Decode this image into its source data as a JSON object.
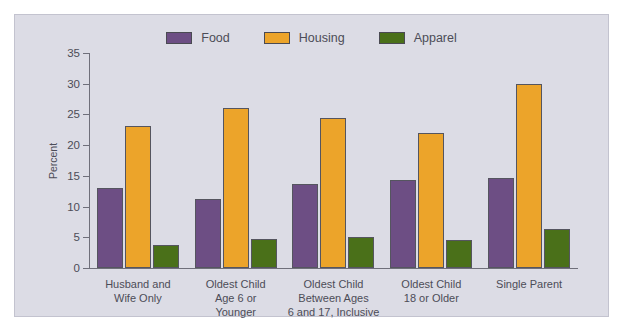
{
  "chart_data": {
    "type": "bar",
    "title": "",
    "xlabel": "",
    "ylabel": "Percent",
    "ylim": [
      0,
      35
    ],
    "yticks": [
      0,
      5,
      10,
      15,
      20,
      25,
      30,
      35
    ],
    "grid": false,
    "legend_position": "top-center",
    "categories": [
      "Husband and\nWife Only",
      "Oldest Child\nAge 6 or\nYounger",
      "Oldest Child\nBetween Ages\n6 and 17, Inclusive",
      "Oldest Child\n18 or Older",
      "Single Parent"
    ],
    "category_lines": [
      [
        "Husband and",
        "Wife Only"
      ],
      [
        "Oldest Child",
        "Age 6 or",
        "Younger"
      ],
      [
        "Oldest Child",
        "Between Ages",
        "6 and 17, Inclusive"
      ],
      [
        "Oldest Child",
        "18 or Older"
      ],
      [
        "Single Parent"
      ]
    ],
    "series": [
      {
        "name": "Food",
        "color": "#6d4e84",
        "values": [
          13.0,
          11.2,
          13.6,
          14.4,
          14.6
        ]
      },
      {
        "name": "Housing",
        "color": "#eca42a",
        "values": [
          23.2,
          26.0,
          24.4,
          22.0,
          29.9
        ]
      },
      {
        "name": "Apparel",
        "color": "#4a7019",
        "values": [
          3.7,
          4.7,
          5.0,
          4.6,
          6.3
        ]
      }
    ]
  },
  "style": {
    "panel_background": "#dcdce5",
    "panel_border": "#c3c3cf",
    "page_background": "#ffffff",
    "axis_color": "#6f6f7a",
    "text_color": "#4c4c57",
    "bar_outline": "#55555f"
  }
}
